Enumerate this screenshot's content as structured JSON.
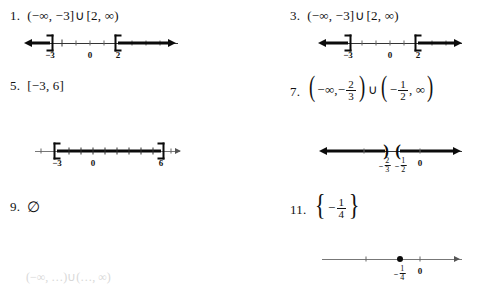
{
  "page": {
    "background_color": "#ffffff",
    "ink_color": "#111111"
  },
  "problems": [
    {
      "id": "p1",
      "number": "1.",
      "expression_text": "(-∞, -3]∪[2, ∞)",
      "parts": {
        "open_paren": "(",
        "neg_infinity": "−∞",
        "comma": ",",
        "neg_three": "−3",
        "close_bracket": "]",
        "union": "∪",
        "open_bracket": "[",
        "two": "2",
        "comma2": ",",
        "infinity": "∞",
        "close_paren": ")"
      },
      "graph": {
        "type": "number-line",
        "tick_labels": [
          "−3",
          "0",
          "2"
        ],
        "endpoints": [
          {
            "value": -3,
            "symbol": "]",
            "closed": true
          },
          {
            "value": 2,
            "symbol": "[",
            "closed": true
          }
        ],
        "rays": [
          "left-from--3",
          "right-from-2"
        ]
      }
    },
    {
      "id": "p3",
      "number": "3.",
      "expression_text": "(-∞, -3]∪[2, ∞)",
      "parts": {
        "open_paren": "(",
        "neg_infinity": "−∞",
        "comma": ",",
        "neg_three": "−3",
        "close_bracket": "]",
        "union": "∪",
        "open_bracket": "[",
        "two": "2",
        "comma2": ",",
        "infinity": "∞",
        "close_paren": ")"
      },
      "graph": {
        "type": "number-line",
        "tick_labels": [
          "−3",
          "0",
          "2"
        ],
        "endpoints": [
          {
            "value": -3,
            "symbol": "]",
            "closed": true
          },
          {
            "value": 2,
            "symbol": "[",
            "closed": true
          }
        ],
        "rays": [
          "left-from--3",
          "right-from-2"
        ]
      }
    },
    {
      "id": "p5",
      "number": "5.",
      "expression_text": "[-3, 6]",
      "parts": {
        "open_bracket": "[",
        "neg_three": "−3",
        "comma": ",",
        "six": "6",
        "close_bracket": "]"
      },
      "graph": {
        "type": "number-line",
        "tick_labels": [
          "−3",
          "0",
          "6"
        ],
        "endpoints": [
          {
            "value": -3,
            "symbol": "[",
            "closed": true
          },
          {
            "value": 6,
            "symbol": "]",
            "closed": true
          }
        ],
        "segment": "from--3-to-6"
      }
    },
    {
      "id": "p7",
      "number": "7.",
      "expression_text": "(-∞, -2/3)∪(-1/2, ∞)",
      "parts": {
        "open_paren": "(",
        "neg_infinity": "−∞",
        "comma": ",",
        "minus": "−",
        "frac1_num": "2",
        "frac1_den": "3",
        "close_paren": ")",
        "union": "∪",
        "open_paren2": "(",
        "minus2": "−",
        "frac2_num": "1",
        "frac2_den": "2",
        "comma2": ",",
        "infinity": "∞",
        "close_paren2": ")"
      },
      "graph": {
        "type": "number-line",
        "tick_labels": [
          "−2/3",
          "−1/2",
          "0"
        ],
        "label_fracs": [
          {
            "sign": "−",
            "num": "2",
            "den": "3"
          },
          {
            "sign": "−",
            "num": "1",
            "den": "2"
          }
        ],
        "zero_label": "0",
        "endpoints": [
          {
            "value": -0.6667,
            "symbol": ")",
            "closed": false
          },
          {
            "value": -0.5,
            "symbol": "(",
            "closed": false
          }
        ],
        "rays": [
          "left-from--2/3",
          "right-from--1/2"
        ]
      }
    },
    {
      "id": "p9",
      "number": "9.",
      "expression_text": "∅",
      "parts": {
        "empty_set": "∅"
      },
      "graph": null
    },
    {
      "id": "p11",
      "number": "11.",
      "expression_text": "{-1/4}",
      "parts": {
        "open_brace": "{",
        "minus": "−",
        "frac_num": "1",
        "frac_den": "4",
        "close_brace": "}"
      },
      "graph": {
        "type": "number-line",
        "tick_labels": [
          "−1/4",
          "0"
        ],
        "label_fracs": [
          {
            "sign": "−",
            "num": "1",
            "den": "4"
          }
        ],
        "zero_label": "0",
        "points": [
          {
            "value": -0.25,
            "symbol": "●",
            "filled": true
          }
        ]
      }
    }
  ],
  "cut_off_row": {
    "visible": true,
    "note": "faint partially cropped next problem row at bottom edge",
    "fragment": "(−∞, …)∪(…, ∞)"
  }
}
